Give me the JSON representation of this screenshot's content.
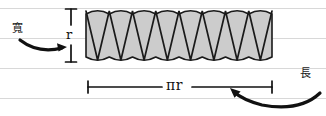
{
  "diagram": {
    "paper": {
      "background_color": "#ffffff",
      "rule_color": "#d8d8d8",
      "rule_y_positions": [
        8,
        38,
        68,
        98
      ]
    },
    "shape": {
      "name": "zigzag-sector-strip",
      "fill_color": "#cccccc",
      "stroke_color": "#1a1a1a",
      "bounds": {
        "x": 86,
        "y": 9,
        "width": 186,
        "height": 53
      },
      "wedge_count": 8,
      "description": "circle cut into sectors rearranged as a rectangle"
    },
    "dimensions": {
      "vertical": {
        "label": "r",
        "name": "height-dimension",
        "x": 71,
        "y_top": 9,
        "y_bottom": 62
      },
      "horizontal": {
        "label": "πr",
        "name": "width-dimension",
        "y": 87,
        "x_left": 88,
        "x_right": 272
      }
    },
    "annotations": [
      {
        "name": "width-annotation",
        "text": "寬",
        "meaning": "width",
        "x": 12,
        "y": 23,
        "arrow": "curved-arrow-right"
      },
      {
        "name": "length-annotation",
        "text": "長",
        "meaning": "length",
        "x": 300,
        "y": 68,
        "arrow": "curved-arrow-left"
      }
    ]
  }
}
